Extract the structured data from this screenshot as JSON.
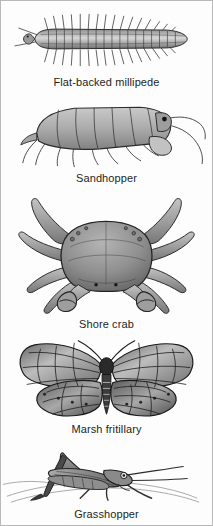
{
  "plate": {
    "background_color": "#fdfdfd",
    "border_color": "#b9b9b9",
    "caption_color": "#1d1d1d",
    "ink_color": "#3a3a3a",
    "entries": [
      {
        "caption": "Flat-backed millipede",
        "icon": "millipede-illustration"
      },
      {
        "caption": "Sandhopper",
        "icon": "sandhopper-illustration"
      },
      {
        "caption": "Shore crab",
        "icon": "shore-crab-illustration"
      },
      {
        "caption": "Marsh fritillary",
        "icon": "marsh-fritillary-illustration"
      },
      {
        "caption": "Grasshopper",
        "icon": "grasshopper-illustration"
      }
    ]
  }
}
